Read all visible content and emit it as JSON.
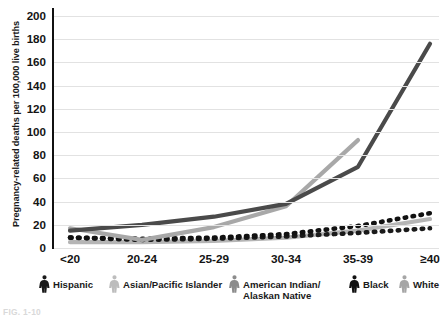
{
  "chart_data": {
    "type": "line",
    "title": "",
    "xlabel": "",
    "ylabel": "Pregnancy-related deaths per 100,000 live births",
    "categories": [
      "<20",
      "20-24",
      "25-29",
      "30-34",
      "35-39",
      "≥40"
    ],
    "ylim": [
      0,
      200
    ],
    "ytick_step": 20,
    "yticks": [
      "0",
      "20",
      "40",
      "60",
      "80",
      "100",
      "120",
      "140",
      "160",
      "180",
      "200"
    ],
    "grid": true,
    "legend_position": "bottom",
    "series": [
      {
        "name": "Hispanic",
        "color": "#1a1a1a",
        "style": "dotted",
        "icon": "female-figure-icon",
        "values": [
          9,
          7,
          8,
          10,
          13,
          17
        ]
      },
      {
        "name": "Asian/Pacific Islander",
        "color": "#a8a8a8",
        "style": "solid",
        "icon": "female-figure-icon",
        "values": [
          17,
          7,
          18,
          36,
          93,
          null
        ]
      },
      {
        "name": "American Indian/ Alaskan Native",
        "color": "#4a4a4a",
        "style": "solid",
        "icon": "female-figure-icon",
        "values": [
          15,
          20,
          27,
          38,
          70,
          176
        ]
      },
      {
        "name": "Black",
        "color": "#111111",
        "style": "dotted",
        "icon": "female-figure-icon",
        "values": [
          9,
          8,
          9,
          12,
          19,
          30
        ]
      },
      {
        "name": "White",
        "color": "#b5b5b5",
        "style": "solid",
        "icon": "female-figure-icon",
        "values": [
          5,
          5,
          6,
          9,
          15,
          25
        ]
      }
    ]
  },
  "legend": {
    "items": [
      {
        "label": "Hispanic",
        "color": "#1a1a1a"
      },
      {
        "label": "Asian/Pacific Islander",
        "color": "#bdbdbd"
      },
      {
        "label": "American Indian/ Alaskan Native",
        "color": "#8c8c8c"
      },
      {
        "label": "Black",
        "color": "#121212"
      },
      {
        "label": "White",
        "color": "#a6a6a6"
      }
    ]
  },
  "caption": "FIG. 1-10"
}
